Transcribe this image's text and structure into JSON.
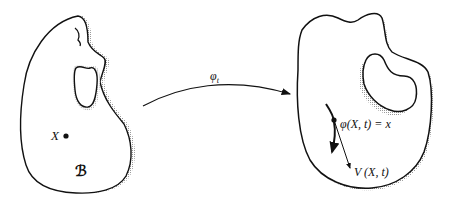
{
  "diagram": {
    "left_body": {
      "point_label": "X",
      "body_label": "ℬ"
    },
    "mapping": {
      "label_base": "φ",
      "label_sub": "t"
    },
    "right_body": {
      "point_label": "φ(X, t) = x",
      "velocity_label": "V (X, t)"
    },
    "colors": {
      "stroke": "#111111",
      "shading": "#bdbdbd",
      "background": "#ffffff"
    }
  }
}
